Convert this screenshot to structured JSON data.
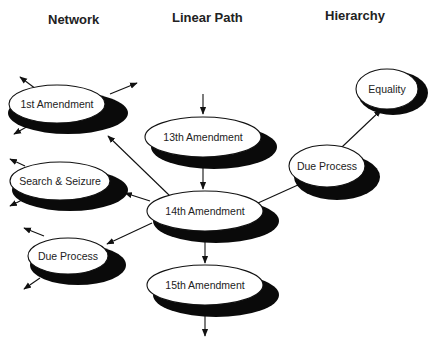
{
  "headings": {
    "network": "Network",
    "linear_path": "Linear Path",
    "hierarchy": "Hierarchy"
  },
  "nodes": {
    "network_1st_amendment": "1st Amendment",
    "network_search_seizure": "Search & Seizure",
    "network_due_process": "Due Process",
    "linear_13th_amendment": "13th Amendment",
    "linear_14th_amendment": "14th Amendment",
    "linear_15th_amendment": "15th Amendment",
    "hierarchy_due_process": "Due Process",
    "hierarchy_equality": "Equality"
  },
  "edges": [
    {
      "from": "incoming",
      "to": "13th Amendment"
    },
    {
      "from": "13th Amendment",
      "to": "14th Amendment"
    },
    {
      "from": "14th Amendment",
      "to": "15th Amendment"
    },
    {
      "from": "15th Amendment",
      "to": "outgoing"
    },
    {
      "from": "14th Amendment",
      "to": "1st Amendment"
    },
    {
      "from": "14th Amendment",
      "to": "Search & Seizure"
    },
    {
      "from": "14th Amendment",
      "to": "Due Process (network)"
    },
    {
      "from": "14th Amendment",
      "to": "Due Process (hierarchy)"
    },
    {
      "from": "Due Process (hierarchy)",
      "to": "Equality"
    }
  ]
}
